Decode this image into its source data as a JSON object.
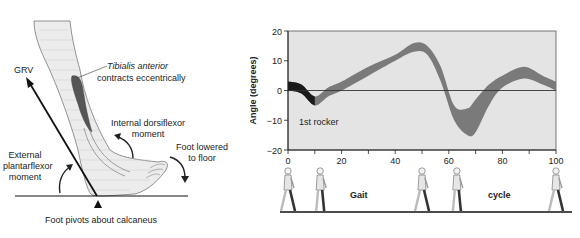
{
  "foot_diagram": {
    "grv_label": "GRV",
    "tibialis_label_italic": "Tibialis anterior",
    "tibialis_label_rest": "contracts eccentrically",
    "internal_moment_line1": "Internal dorsiflexor",
    "internal_moment_line2": "moment",
    "external_moment_line1": "External",
    "external_moment_line2": "plantarflexor",
    "external_moment_line3": "moment",
    "foot_lowered_line1": "Foot lowered",
    "foot_lowered_line2": "to floor",
    "pivot_label": "Foot pivots about calcaneus"
  },
  "gait_strip": {
    "label_left": "Gait",
    "label_right": "cycle",
    "figure_positions_pct": [
      0,
      12,
      50,
      63,
      100
    ]
  },
  "chart_data": {
    "type": "area",
    "title": "",
    "xlabel": "",
    "ylabel": "Angle (degrees)",
    "xlim": [
      0,
      100
    ],
    "ylim": [
      -20,
      20
    ],
    "xticks": [
      0,
      20,
      40,
      60,
      80,
      100
    ],
    "xticks_minor": [
      10,
      30,
      50,
      70,
      90
    ],
    "yticks": [
      -20,
      -10,
      0,
      10,
      20
    ],
    "grid": false,
    "zero_line": true,
    "annotation": "1st rocker",
    "series": [
      {
        "name": "Ankle angle range (upper)",
        "x": [
          0,
          5,
          10,
          15,
          20,
          30,
          40,
          47,
          52,
          57,
          62,
          67,
          70,
          75,
          80,
          88,
          95,
          100
        ],
        "values": [
          3,
          2,
          -2,
          1,
          3,
          8,
          12,
          16,
          15,
          8,
          -5,
          -6,
          -3,
          2,
          5,
          8,
          5,
          3
        ]
      },
      {
        "name": "Ankle angle range (lower)",
        "x": [
          0,
          5,
          10,
          15,
          20,
          30,
          40,
          47,
          52,
          57,
          62,
          67,
          70,
          75,
          80,
          88,
          95,
          100
        ],
        "values": [
          0,
          -1,
          -5,
          -2,
          0,
          5,
          10,
          13,
          12,
          3,
          -10,
          -15,
          -14,
          -5,
          1,
          4,
          2,
          0
        ]
      }
    ],
    "highlight": {
      "name": "1st rocker",
      "x_range": [
        0,
        10
      ],
      "color": "#1a1a1a"
    },
    "colors": {
      "band": "#7a7a7a",
      "highlight": "#1a1a1a",
      "plot_bg": "#e4e4e4",
      "axis": "#333333"
    }
  }
}
